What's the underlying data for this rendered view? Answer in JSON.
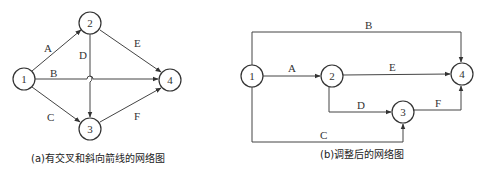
{
  "diagram_a": {
    "caption": "(a)有交叉和斜向箭线的网络图",
    "nodes": [
      {
        "id": "1",
        "label": "1"
      },
      {
        "id": "2",
        "label": "2"
      },
      {
        "id": "3",
        "label": "3"
      },
      {
        "id": "4",
        "label": "4"
      }
    ],
    "edges": [
      {
        "from": "1",
        "to": "2",
        "label": "A"
      },
      {
        "from": "1",
        "to": "4",
        "label": "B"
      },
      {
        "from": "1",
        "to": "3",
        "label": "C"
      },
      {
        "from": "2",
        "to": "3",
        "label": "D"
      },
      {
        "from": "2",
        "to": "4",
        "label": "E"
      },
      {
        "from": "3",
        "to": "4",
        "label": "F"
      }
    ]
  },
  "diagram_b": {
    "caption": "(b)调整后的网络图",
    "nodes": [
      {
        "id": "1",
        "label": "1"
      },
      {
        "id": "2",
        "label": "2"
      },
      {
        "id": "3",
        "label": "3"
      },
      {
        "id": "4",
        "label": "4"
      }
    ],
    "edges": [
      {
        "from": "1",
        "to": "2",
        "label": "A"
      },
      {
        "from": "1",
        "to": "4",
        "label": "B"
      },
      {
        "from": "1",
        "to": "3",
        "label": "C"
      },
      {
        "from": "2",
        "to": "3",
        "label": "D"
      },
      {
        "from": "2",
        "to": "4",
        "label": "E"
      },
      {
        "from": "3",
        "to": "4",
        "label": "F"
      }
    ]
  }
}
